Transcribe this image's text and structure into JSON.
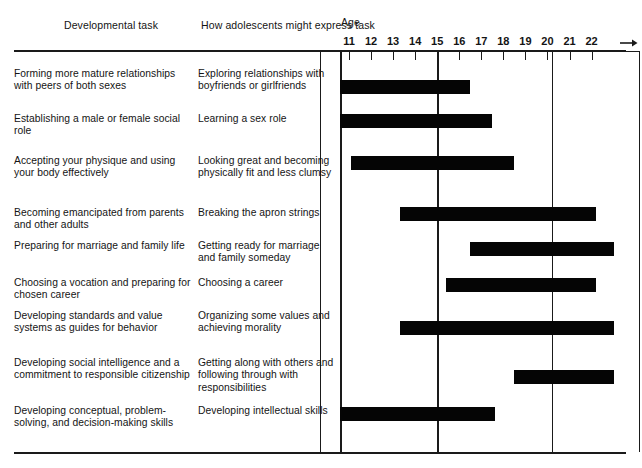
{
  "headers": {
    "task_column": "Developmental task",
    "express_column": "How adolescents might express task",
    "age_label": "Age"
  },
  "chart_data": {
    "type": "bar",
    "orientation": "horizontal",
    "xlabel": "Age",
    "ylabel": "",
    "xlim": [
      10.4,
      22.7
    ],
    "grid": true,
    "legend": false,
    "tick_labels": [
      "11",
      "12",
      "13",
      "14",
      "15",
      "16",
      "17",
      "18",
      "19",
      "20",
      "21",
      "22"
    ],
    "tick_values": [
      11,
      12,
      13,
      14,
      15,
      16,
      17,
      18,
      19,
      20,
      21,
      22
    ],
    "axis_arrow": true,
    "gridline_values": [
      10.6,
      15.0,
      20.2
    ],
    "categories": [
      "Forming more mature relationships with peers of both sexes",
      "Establishing a male or female social role",
      "Accepting your physique and using your body effectively",
      "Becoming emancipated from parents and other adults",
      "Preparing for marriage and family life",
      "Choosing a vocation and preparing for chosen career",
      "Developing standards and value systems as guides for behavior",
      "Developing social intelligence and a commitment to responsible citizenship",
      "Developing conceptual, problem-solving, and decision-making skills"
    ],
    "spans": [
      {
        "start": 10.6,
        "end": 16.5
      },
      {
        "start": 10.6,
        "end": 17.5
      },
      {
        "start": 11.1,
        "end": 18.5
      },
      {
        "start": 13.3,
        "end": 22.2
      },
      {
        "start": 16.5,
        "end": 23.0
      },
      {
        "start": 15.4,
        "end": 22.2
      },
      {
        "start": 13.3,
        "end": 23.0
      },
      {
        "start": 18.5,
        "end": 23.0
      },
      {
        "start": 10.6,
        "end": 17.6
      }
    ]
  },
  "rows": [
    {
      "task": "Forming more mature relationships with peers of both sexes",
      "express": "Exploring relationships with boyfriends or girlfriends"
    },
    {
      "task": "Establishing a male or female social role",
      "express": "Learning a sex role"
    },
    {
      "task": "Accepting your physique and using your body effectively",
      "express": "Looking great and becoming physically fit and less clumsy"
    },
    {
      "task": "Becoming emancipated from parents and other adults",
      "express": "Breaking the apron strings"
    },
    {
      "task": "Preparing for marriage and family life",
      "express": "Getting ready for marriage and family someday"
    },
    {
      "task": "Choosing a vocation and preparing for chosen career",
      "express": "Choosing a career"
    },
    {
      "task": "Developing standards and value systems as guides for behavior",
      "express": "Organizing some values and achieving morality"
    },
    {
      "task": "Developing social intelligence and a commitment to responsible citizenship",
      "express": "Getting along with others and following through with responsibilities"
    },
    {
      "task": "Developing conceptual, problem-solving, and decision-making skills",
      "express": "Developing intellectual skills"
    }
  ],
  "colors": {
    "bar": "#050505",
    "rule": "#1a1a1a",
    "text": "#141414",
    "background": "#ffffff"
  }
}
